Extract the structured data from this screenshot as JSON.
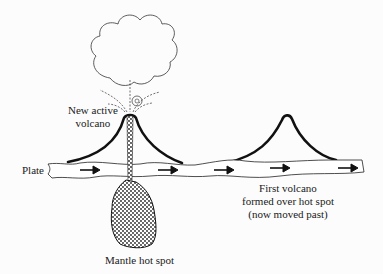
{
  "diagram": {
    "colors": {
      "background": "#fcfcfc",
      "ink": "#111111",
      "magma_fill": "#555555"
    },
    "labels": {
      "new_volcano_line1": "New active",
      "new_volcano_line2": "volcano",
      "plate": "Plate",
      "hot_spot": "Mantle hot spot",
      "first_volcano_line1": "First volcano",
      "first_volcano_line2": "formed over  hot spot",
      "first_volcano_line3": "(now moved past)"
    },
    "arrows": [
      {
        "x": 80,
        "y": 170,
        "direction": "right"
      },
      {
        "x": 165,
        "y": 170,
        "direction": "right"
      },
      {
        "x": 215,
        "y": 170,
        "direction": "right"
      },
      {
        "x": 270,
        "y": 169,
        "direction": "right"
      },
      {
        "x": 338,
        "y": 169,
        "direction": "right"
      }
    ]
  }
}
